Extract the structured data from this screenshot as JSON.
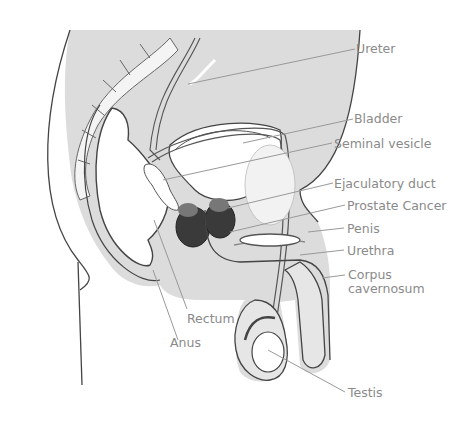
{
  "diagram": {
    "type": "anatomical-cross-section",
    "colors": {
      "tissue_fill": "#dcdcdc",
      "outline": "#444444",
      "tumor": "#3a3a3a",
      "label_text": "#8a8a8a",
      "leader_line": "#999999"
    },
    "labels": [
      {
        "id": "ureter",
        "text": "Ureter"
      },
      {
        "id": "bladder",
        "text": "Bladder"
      },
      {
        "id": "seminal-vesicle",
        "text": "Seminal vesicle"
      },
      {
        "id": "ejaculatory-duct",
        "text": "Ejaculatory duct"
      },
      {
        "id": "prostate-cancer",
        "text": "Prostate Cancer"
      },
      {
        "id": "penis",
        "text": "Penis"
      },
      {
        "id": "urethra",
        "text": "Urethra"
      },
      {
        "id": "corpus-cavernosum-1",
        "text": "Corpus"
      },
      {
        "id": "corpus-cavernosum-2",
        "text": "cavernosum"
      },
      {
        "id": "rectum",
        "text": "Rectum"
      },
      {
        "id": "anus",
        "text": "Anus"
      },
      {
        "id": "testis",
        "text": "Testis"
      }
    ]
  }
}
